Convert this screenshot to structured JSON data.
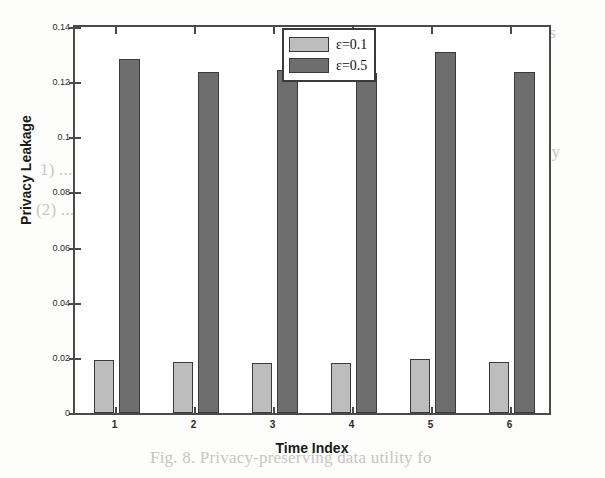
{
  "chart_data": {
    "type": "bar",
    "title": "",
    "xlabel": "Time Index",
    "ylabel": "Privacy Leakage",
    "categories": [
      "1",
      "2",
      "3",
      "4",
      "5",
      "6"
    ],
    "ylim": [
      0,
      0.14
    ],
    "xlim": [
      0.5,
      6.5
    ],
    "yticks": [
      "0",
      "0.02",
      "0.04",
      "0.06",
      "0.08",
      "0.1",
      "0.12",
      "0.14"
    ],
    "ytick_values": [
      0,
      0.02,
      0.04,
      0.06,
      0.08,
      0.1,
      0.12,
      0.14
    ],
    "grid": false,
    "legend_position": "top-center",
    "series": [
      {
        "name": "ε=0.1",
        "color": "#bdbdbd",
        "values": [
          0.0192,
          0.0185,
          0.0182,
          0.0183,
          0.0196,
          0.0184
        ]
      },
      {
        "name": "ε=0.5",
        "color": "#6e6e6e",
        "values": [
          0.1283,
          0.1238,
          0.1245,
          0.1232,
          0.131,
          0.1238
        ]
      }
    ]
  },
  "legend": {
    "items": [
      {
        "label": "ε=0.1",
        "color": "#bdbdbd"
      },
      {
        "label": "ε=0.5",
        "color": "#6e6e6e"
      }
    ]
  },
  "axes": {
    "x_title": "Time Index",
    "y_title": "Privacy Leakage"
  },
  "background_text": {
    "lines": [
      "ε, frequency ... σ ∈ [0.1, 0.5] expres",
      "a much better privacy leakage than",
      "privacy of the healthy individual.",
      "8. Also in Fig. 4 note that in pri",
      "are preserved when the privacy is fully",
      "a demonstration",
      "leakage of the data under the",
      "we consider the privacy level in",
      "privacy and the histogram is in the",
      "Fig. 8. Privacy-preserving data utility fo",
      "1) ... σ",
      "(2) ... 10"
    ]
  },
  "colors": {
    "light_bar": "#bdbdbd",
    "dark_bar": "#6e6e6e",
    "axis": "#4a4a4a",
    "page": "#fdfdfb"
  }
}
